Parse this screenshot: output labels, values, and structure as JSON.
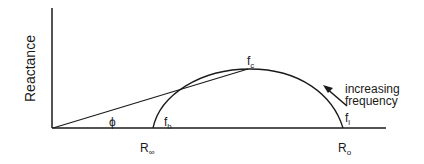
{
  "diagram": {
    "y_axis_label": "Reactance",
    "angle_label": "ϕ",
    "points": {
      "fc": {
        "base": "f",
        "sub": "c"
      },
      "fh": {
        "base": "f",
        "sub": "h"
      },
      "fl": {
        "base": "f",
        "sub": "l"
      }
    },
    "x_labels": {
      "r_inf": {
        "base": "R",
        "sub": "∞"
      },
      "r_0": {
        "base": "R",
        "sub": "o"
      }
    },
    "annotation": {
      "line1": "increasing",
      "line2": "frequency"
    },
    "colors": {
      "stroke": "#1a1a1a",
      "background": "#ffffff"
    }
  }
}
